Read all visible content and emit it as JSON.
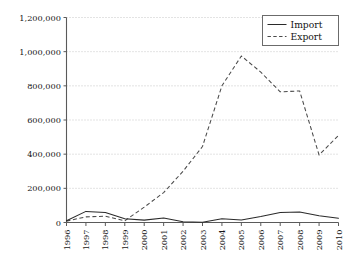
{
  "chart_data": {
    "type": "line",
    "title": "",
    "xlabel": "",
    "ylabel": "",
    "categories": [
      "1996",
      "1997",
      "1998",
      "1999",
      "2000",
      "2001",
      "2002",
      "2003",
      "2004",
      "2005",
      "2006",
      "2007",
      "2008",
      "2009",
      "2010"
    ],
    "ylim": [
      0,
      1200000
    ],
    "xlim": [
      "1996",
      "2010"
    ],
    "ytick_labels": [
      "0",
      "200,000",
      "400,000",
      "600,000",
      "800,000",
      "1,000,000",
      "1,200,000"
    ],
    "ytick_values": [
      0,
      200000,
      400000,
      600000,
      800000,
      1000000,
      1200000
    ],
    "grid": true,
    "grid_style": "dotted-horizontal",
    "legend_position": "top-right",
    "series": [
      {
        "name": "Import",
        "style": "solid",
        "color": "#2a2a2a",
        "values": [
          10000,
          65000,
          58000,
          22000,
          14000,
          26000,
          5000,
          2000,
          22000,
          15000,
          35000,
          58000,
          62000,
          40000,
          25000
        ]
      },
      {
        "name": "Export",
        "style": "dashed",
        "color": "#4a4a4a",
        "values": [
          8000,
          33000,
          37000,
          10000,
          90000,
          175000,
          300000,
          445000,
          800000,
          975000,
          880000,
          765000,
          770000,
          395000,
          510000
        ]
      }
    ]
  },
  "legend": {
    "items": [
      {
        "label": "Import"
      },
      {
        "label": "Export"
      }
    ]
  }
}
